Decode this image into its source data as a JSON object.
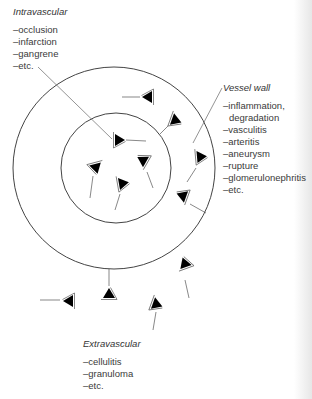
{
  "intravascular": {
    "title": "Intravascular",
    "items": [
      "–occlusion",
      "–infarction",
      "–gangrene",
      "–etc."
    ]
  },
  "vessel_wall": {
    "title": "Vessel wall",
    "items": [
      "–inflammation,",
      " degradation",
      "–vasculitis",
      "–arteritis",
      "–aneurysm",
      "–rupture",
      "–glomerulonephritis",
      "–etc."
    ]
  },
  "extravascular": {
    "title": "Extravascular",
    "items": [
      "–cellulitis",
      "–granuloma",
      "–etc."
    ]
  },
  "diagram": {
    "outer_circle": {
      "cx": 114,
      "cy": 168,
      "r": 101
    },
    "inner_circle": {
      "cx": 116,
      "cy": 168,
      "r": 55
    },
    "line_color": "#444444",
    "fill_color": "#000000"
  }
}
